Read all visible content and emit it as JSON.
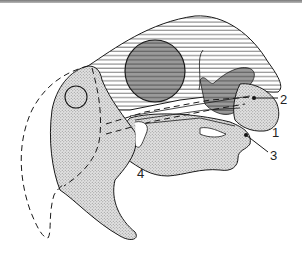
{
  "figure": {
    "type": "anatomical-diagram",
    "colors": {
      "background": "#ffffff",
      "outline": "#1a1a1a",
      "stipple_fill": "#d4d4d4",
      "hatch_line": "#6a6a6a",
      "dark_fill": "#8f8f8f",
      "top_bar": "#8a8a8a"
    },
    "labels": [
      {
        "id": "1",
        "text": "1",
        "x": 272,
        "y": 137
      },
      {
        "id": "2",
        "text": "2",
        "x": 280,
        "y": 104
      },
      {
        "id": "3",
        "text": "3",
        "x": 270,
        "y": 160
      },
      {
        "id": "4",
        "text": "4",
        "x": 137,
        "y": 178
      }
    ],
    "regions": [
      {
        "name": "cranial-vault",
        "fill": "horizontal-hatch"
      },
      {
        "name": "orbit",
        "fill": "dark-hatch"
      },
      {
        "name": "face-snout",
        "fill": "stipple"
      },
      {
        "name": "mandible",
        "fill": "stipple"
      },
      {
        "name": "lower-jaw-process",
        "fill": "stipple"
      },
      {
        "name": "dashed-outline-beak",
        "fill": "none"
      }
    ]
  }
}
